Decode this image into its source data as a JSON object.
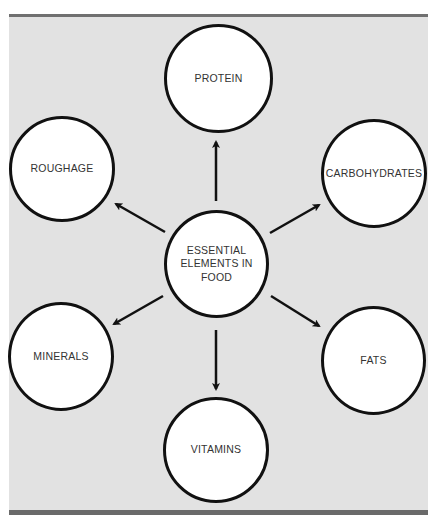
{
  "diagram": {
    "type": "hub-and-spoke",
    "center": {
      "label_lines": [
        "ESSENTIAL",
        "ELEMENTS IN",
        "FOOD"
      ]
    },
    "nodes": [
      {
        "id": "protein",
        "label": "PROTEIN"
      },
      {
        "id": "carbohydrates",
        "label": "CARBOHYDRATES"
      },
      {
        "id": "fats",
        "label": "FATS"
      },
      {
        "id": "vitamins",
        "label": "VITAMINS"
      },
      {
        "id": "minerals",
        "label": "MINERALS"
      },
      {
        "id": "roughage",
        "label": "ROUGHAGE"
      }
    ],
    "edges": [
      {
        "from": "center",
        "to": "protein"
      },
      {
        "from": "center",
        "to": "carbohydrates"
      },
      {
        "from": "center",
        "to": "fats"
      },
      {
        "from": "center",
        "to": "vitamins"
      },
      {
        "from": "center",
        "to": "minerals"
      },
      {
        "from": "center",
        "to": "roughage"
      }
    ]
  },
  "colors": {
    "background_panel": "#e2e2e2",
    "border_bars": "#6e6e6e",
    "circle_fill": "#ffffff",
    "circle_stroke": "#111111",
    "text": "#333333"
  }
}
